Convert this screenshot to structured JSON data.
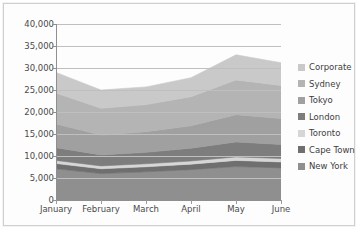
{
  "chart_data": {
    "type": "area",
    "stacked": true,
    "title": "",
    "xlabel": "",
    "ylabel": "",
    "grid": true,
    "legend_position": "right",
    "categories": [
      "January",
      "February",
      "March",
      "April",
      "May",
      "June"
    ],
    "ylim": [
      0,
      40000
    ],
    "yticks": [
      0,
      5000,
      10000,
      15000,
      20000,
      25000,
      30000,
      35000,
      40000
    ],
    "ytick_labels": [
      "0",
      "5,000",
      "10,000",
      "15,000",
      "20,000",
      "25,000",
      "30,000",
      "35,000",
      "40,000"
    ],
    "series": [
      {
        "name": "New York",
        "color": "#8f8f8f",
        "values": [
          7100,
          6000,
          6400,
          6900,
          7600,
          7300
        ]
      },
      {
        "name": "Cape Town",
        "color": "#6f6f6f",
        "values": [
          1200,
          1100,
          1150,
          1250,
          1400,
          1350
        ]
      },
      {
        "name": "Toronto",
        "color": "#d6d6d6",
        "values": [
          700,
          650,
          680,
          720,
          800,
          780
        ]
      },
      {
        "name": "London",
        "color": "#7d7d7d",
        "values": [
          2900,
          2500,
          2600,
          2900,
          3400,
          3200
        ]
      },
      {
        "name": "Tokyo",
        "color": "#a0a0a0",
        "values": [
          5400,
          4500,
          4700,
          5100,
          6200,
          5900
        ]
      },
      {
        "name": "Sydney",
        "color": "#b4b4b4",
        "values": [
          7000,
          6100,
          6150,
          6600,
          7900,
          7500
        ]
      },
      {
        "name": "Corporate",
        "color": "#c9c9c9",
        "values": [
          4700,
          4150,
          4020,
          4330,
          5700,
          5170
        ]
      }
    ],
    "totals": [
      29000,
      25000,
      25700,
      27800,
      33000,
      31200
    ]
  },
  "legend": {
    "items": [
      {
        "label": "Corporate",
        "swatch": "#c9c9c9"
      },
      {
        "label": "Sydney",
        "swatch": "#b4b4b4"
      },
      {
        "label": "Tokyo",
        "swatch": "#a0a0a0"
      },
      {
        "label": "London",
        "swatch": "#7d7d7d"
      },
      {
        "label": "Toronto",
        "swatch": "#d6d6d6"
      },
      {
        "label": "Cape Town",
        "swatch": "#6f6f6f"
      },
      {
        "label": "New York",
        "swatch": "#8f8f8f"
      }
    ]
  },
  "colors": {
    "gridline": "#bfbfbf",
    "axis": "#8f8f8f",
    "plot_background": "#ffffff",
    "text": "#4a4a4a",
    "frame_border": "#cfcfcf"
  }
}
